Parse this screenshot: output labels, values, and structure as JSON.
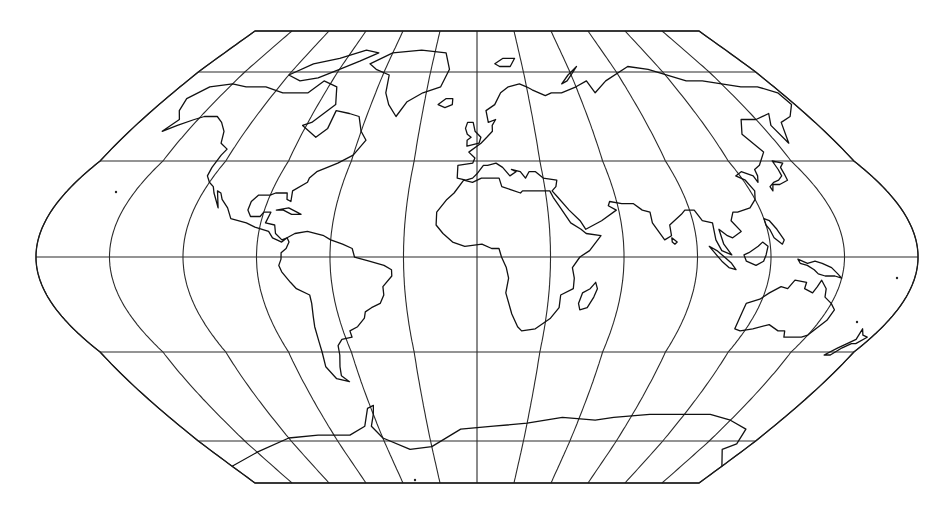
{
  "map": {
    "title": "World map — pseudocylindrical projection with graticule",
    "projection": {
      "type": "flat-polar pseudocylindrical",
      "center_x": 477,
      "equator_y": 257,
      "north_pole_y": 31,
      "south_pole_y": 483,
      "equator_half_width": 441,
      "pole_half_width": 222,
      "central_meridian_deg": 0
    },
    "graticule": {
      "meridian_step_deg": 30,
      "parallels_y": [
        31,
        72,
        161,
        257,
        352,
        441,
        483
      ],
      "parallel_labels_deg": [
        90,
        75,
        45,
        0,
        -45,
        -75,
        -90
      ],
      "line_color": "#2a2a2a"
    },
    "style": {
      "background": "#ffffff",
      "coast_color": "#111111"
    },
    "continents": [
      "North America",
      "Greenland",
      "South America",
      "Europe",
      "Africa",
      "Madagascar",
      "Asia",
      "Indonesia",
      "New Guinea",
      "Australia",
      "New Zealand",
      "Antarctica",
      "Iceland",
      "British Isles",
      "Japan",
      "Arctic Archipelago"
    ]
  }
}
